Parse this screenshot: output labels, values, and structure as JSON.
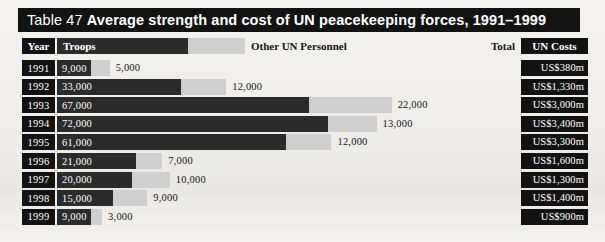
{
  "title": {
    "number": "Table 47",
    "main": "Average strength and cost of UN peacekeeping forces, 1991–1999"
  },
  "header": {
    "year": "Year",
    "troops": "Troops",
    "other": "Other UN Personnel",
    "total": "Total",
    "cost": "UN Costs"
  },
  "chart_data": {
    "type": "bar",
    "title": "Average strength and cost of UN peacekeeping forces, 1991–1999",
    "xlabel": "",
    "ylabel": "Year",
    "stacked": true,
    "categories": [
      "1991",
      "1992",
      "1993",
      "1994",
      "1995",
      "1996",
      "1997",
      "1998",
      "1999"
    ],
    "series": [
      {
        "name": "Troops",
        "values": [
          9000,
          33000,
          67000,
          72000,
          61000,
          21000,
          20000,
          15000,
          9000
        ]
      },
      {
        "name": "Other UN Personnel",
        "values": [
          5000,
          12000,
          22000,
          13000,
          12000,
          7000,
          10000,
          9000,
          3000
        ]
      }
    ],
    "totals": [
      14000,
      45000,
      89000,
      85000,
      73000,
      28000,
      30000,
      24000,
      12000
    ],
    "un_costs": [
      "US$380m",
      "US$1,330m",
      "US$3,000m",
      "US$3,400m",
      "US$3,300m",
      "US$1,600m",
      "US$1,300m",
      "US$1,400m",
      "US$900m"
    ],
    "colors": {
      "troops": "#2b2b2b",
      "other": "#cfcfcf",
      "panel": "#121212",
      "page": "#f2f1ee"
    }
  },
  "rows": [
    {
      "year": "1991",
      "troops": "9,000",
      "other": "5,000",
      "total": "14,000",
      "cost": "US$380m"
    },
    {
      "year": "1992",
      "troops": "33,000",
      "other": "12,000",
      "total": "45,000",
      "cost": "US$1,330m"
    },
    {
      "year": "1993",
      "troops": "67,000",
      "other": "22,000",
      "total": "89,000",
      "cost": "US$3,000m"
    },
    {
      "year": "1994",
      "troops": "72,000",
      "other": "13,000",
      "total": "85,000",
      "cost": "US$3,400m"
    },
    {
      "year": "1995",
      "troops": "61,000",
      "other": "12,000",
      "total": "73,000",
      "cost": "US$3,300m"
    },
    {
      "year": "1996",
      "troops": "21,000",
      "other": "7,000",
      "total": "28,000",
      "cost": "US$1,600m"
    },
    {
      "year": "1997",
      "troops": "20,000",
      "other": "10,000",
      "total": "30,000",
      "cost": "US$1,300m"
    },
    {
      "year": "1998",
      "troops": "15,000",
      "other": "9,000",
      "total": "24,000",
      "cost": "US$1,400m"
    },
    {
      "year": "1999",
      "troops": "9,000",
      "other": "3,000",
      "total": "12,000",
      "cost": "US$900m"
    }
  ]
}
